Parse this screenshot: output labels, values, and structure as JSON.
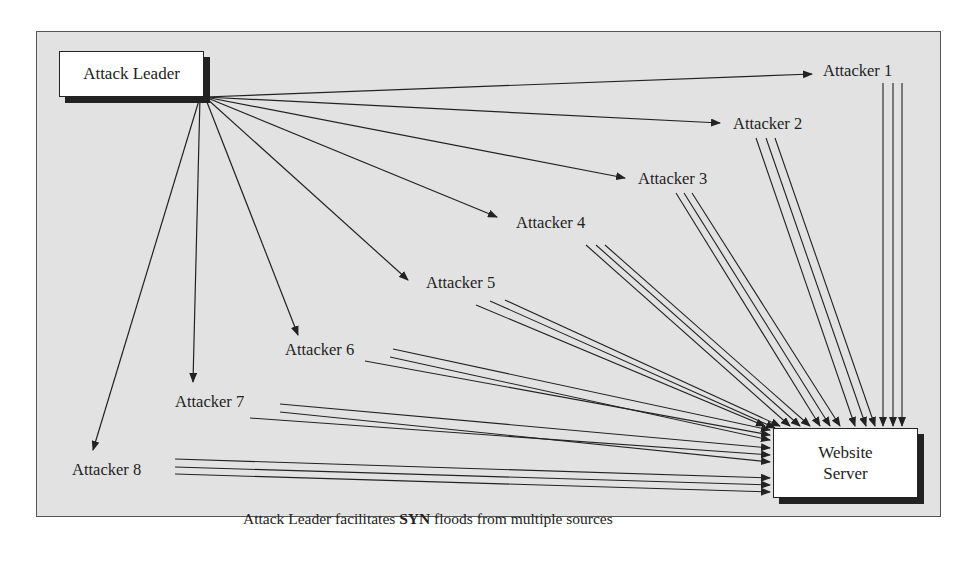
{
  "diagram": {
    "leader": "Attack Leader",
    "server": {
      "line1": "Website",
      "line2": "Server"
    },
    "attackers": [
      {
        "label": "Attacker 1",
        "x": 825,
        "y": 70
      },
      {
        "label": "Attacker 2",
        "x": 733,
        "y": 123
      },
      {
        "label": "Attacker 3",
        "x": 638,
        "y": 178
      },
      {
        "label": "Attacker 4",
        "x": 517,
        "y": 222
      },
      {
        "label": "Attacker 5",
        "x": 427,
        "y": 282
      },
      {
        "label": "Attacker 6",
        "x": 286,
        "y": 348
      },
      {
        "label": "Attacker 7",
        "x": 176,
        "y": 400
      },
      {
        "label": "Attacker 8",
        "x": 73,
        "y": 468
      }
    ],
    "caption": {
      "before": "Attack Leader facilitates ",
      "bold": "SYN",
      "after": " floods from multiple sources"
    }
  }
}
